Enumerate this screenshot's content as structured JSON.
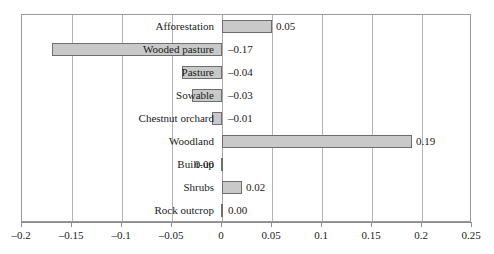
{
  "chart_data": {
    "type": "bar",
    "orientation": "horizontal",
    "title": "",
    "subtitle": "",
    "xlabel": "",
    "ylabel": "",
    "xlim": [
      -0.2,
      0.25
    ],
    "grid": true,
    "legend": null,
    "categories": [
      "Afforestation",
      "Wooded pasture",
      "Pasture",
      "Sowable",
      "Chestnut orchard",
      "Woodland",
      "Built-up",
      "Shrubs",
      "Rock outcrop"
    ],
    "values": [
      0.05,
      -0.17,
      -0.04,
      -0.03,
      -0.01,
      0.19,
      0.0,
      0.02,
      0.0
    ],
    "value_labels": [
      "0.05",
      "–0.17",
      "–0.04",
      "–0.03",
      "–0.01",
      "0.19",
      "0.00",
      "0.02",
      "0.00"
    ],
    "xticks": [
      -0.2,
      -0.15,
      -0.1,
      -0.05,
      0,
      0.05,
      0.1,
      0.15,
      0.2,
      0.25
    ],
    "xtick_labels": [
      "–0.2",
      "–0.15",
      "–0.1",
      "–0.05",
      "0",
      "0.05",
      "0.1",
      "0.15",
      "0.2",
      "0.25"
    ],
    "colors": {
      "bar_fill": "#c9c9c9",
      "bar_border": "#6e6e6e",
      "gridline": "#b4b4b4",
      "frame": "#9a9a9a",
      "text": "#1a1a1a",
      "background": "#ffffff"
    }
  }
}
